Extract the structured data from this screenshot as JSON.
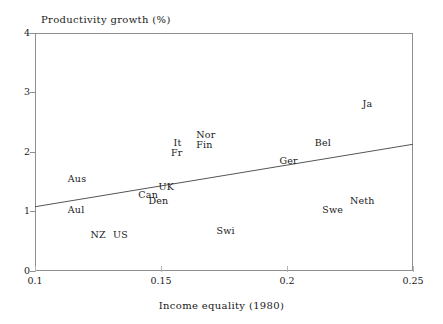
{
  "chart_data": {
    "type": "scatter",
    "title": "",
    "xlabel": "Income equality (1980)",
    "ylabel": "Productivity growth (%)",
    "xlim": [
      0.1,
      0.25
    ],
    "ylim": [
      0,
      4
    ],
    "xticks": [
      "0.1",
      "0.15",
      "0.2",
      "0.25"
    ],
    "xtick_values": [
      0.1,
      0.15,
      0.2,
      0.25
    ],
    "yticks": [
      "0",
      "1",
      "2",
      "3",
      "4"
    ],
    "ytick_values": [
      0,
      1,
      2,
      3,
      4
    ],
    "grid": false,
    "legend": "none",
    "point_style": "text-label-only",
    "points": [
      {
        "label": "Aus",
        "x": 0.113,
        "y": 1.55
      },
      {
        "label": "Aul",
        "x": 0.113,
        "y": 1.02
      },
      {
        "label": "NZ",
        "x": 0.122,
        "y": 0.6
      },
      {
        "label": "US",
        "x": 0.131,
        "y": 0.6
      },
      {
        "label": "Can",
        "x": 0.141,
        "y": 1.27
      },
      {
        "label": "Den",
        "x": 0.145,
        "y": 1.17
      },
      {
        "label": "UK",
        "x": 0.149,
        "y": 1.42
      },
      {
        "label": "It",
        "x": 0.155,
        "y": 2.15
      },
      {
        "label": "Fr",
        "x": 0.154,
        "y": 1.98
      },
      {
        "label": "Nor",
        "x": 0.164,
        "y": 2.28
      },
      {
        "label": "Fin",
        "x": 0.164,
        "y": 2.12
      },
      {
        "label": "Swi",
        "x": 0.172,
        "y": 0.67
      },
      {
        "label": "Ger",
        "x": 0.197,
        "y": 1.85
      },
      {
        "label": "Bel",
        "x": 0.211,
        "y": 2.15
      },
      {
        "label": "Swe",
        "x": 0.214,
        "y": 1.03
      },
      {
        "label": "Neth",
        "x": 0.225,
        "y": 1.18
      },
      {
        "label": "Ja",
        "x": 0.23,
        "y": 2.8
      }
    ],
    "trend_line": {
      "name": "regression-line",
      "x0": 0.1,
      "y0": 1.08,
      "x1": 0.25,
      "y1": 2.13
    },
    "colors": {
      "axis": "#8f8f8f",
      "text": "#1a1a1a",
      "line": "#555555",
      "background": "#ffffff"
    }
  },
  "axis": {
    "y_title": "Productivity growth (%)",
    "x_title": "Income equality (1980)"
  }
}
